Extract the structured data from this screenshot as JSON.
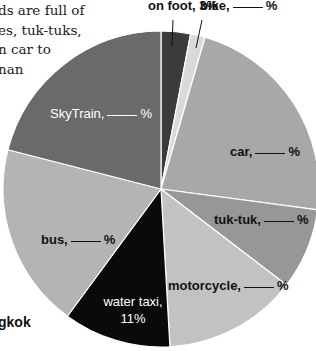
{
  "body_text": {
    "lines": [
      "ds are full of",
      "es, tuk-tuks,",
      "n car to",
      "nan"
    ]
  },
  "side_label": "gkok",
  "chart_data": {
    "type": "pie",
    "title": "",
    "start_angle_deg": 0,
    "direction": "clockwise",
    "center": [
      161,
      189
    ],
    "radius": 158,
    "slices": [
      {
        "name": "on foot",
        "label_prefix": "on foot,",
        "label_value": "3%",
        "value": 3,
        "value_shown": true,
        "color": "#3b3b3b"
      },
      {
        "name": "bike",
        "label_prefix": "bike,",
        "label_value": "%",
        "value": 1.5,
        "value_shown": false,
        "color": "#dadada"
      },
      {
        "name": "car",
        "label_prefix": "car,",
        "label_value": "%",
        "value": 22.6,
        "value_shown": false,
        "color": "#a8a8a8"
      },
      {
        "name": "tuk-tuk",
        "label_prefix": "tuk-tuk,",
        "label_value": "%",
        "value": 8.3,
        "value_shown": false,
        "color": "#979797"
      },
      {
        "name": "motorcycle",
        "label_prefix": "motorcycle,",
        "label_value": "%",
        "value": 13.7,
        "value_shown": false,
        "color": "#c2c2c2"
      },
      {
        "name": "water taxi",
        "label_prefix": "water taxi,",
        "label_value": "11%",
        "value": 11,
        "value_shown": true,
        "color": "#0a0a0a"
      },
      {
        "name": "bus",
        "label_prefix": "bus,",
        "label_value": "%",
        "value": 18.9,
        "value_shown": false,
        "color": "#b4b4b4"
      },
      {
        "name": "SkyTrain",
        "label_prefix": "SkyTrain,",
        "label_value": "%",
        "value": 21.0,
        "value_shown": false,
        "color": "#6a6a6a"
      }
    ],
    "legend": "none",
    "labels_inline": true,
    "note": "Values of unlabeled slices are estimated from slice angles; the chart shows blanks ('___ %') for them."
  }
}
